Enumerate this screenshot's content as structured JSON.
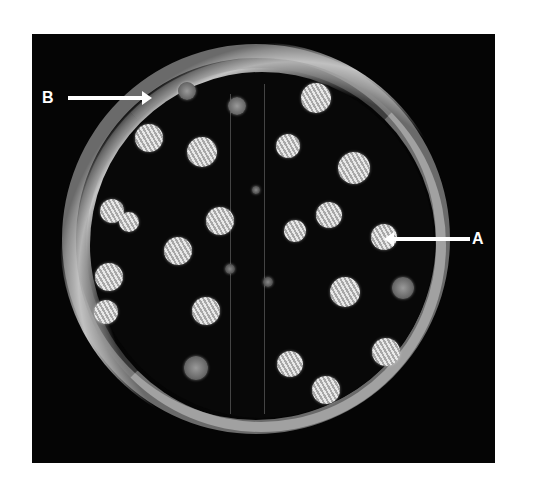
{
  "image": {
    "subject": "petri-dish-with-colonies",
    "background_color": "#050505"
  },
  "annotations": {
    "label_a": "A",
    "label_b": "B"
  },
  "colonies": [
    {
      "x": 155,
      "y": 57,
      "r": 9,
      "style": "dim"
    },
    {
      "x": 205,
      "y": 72,
      "r": 9,
      "style": "dim"
    },
    {
      "x": 284,
      "y": 64,
      "r": 15,
      "style": "bright"
    },
    {
      "x": 117,
      "y": 104,
      "r": 14,
      "style": "bright"
    },
    {
      "x": 170,
      "y": 118,
      "r": 15,
      "style": "bright"
    },
    {
      "x": 256,
      "y": 112,
      "r": 12,
      "style": "bright"
    },
    {
      "x": 322,
      "y": 134,
      "r": 16,
      "style": "bright"
    },
    {
      "x": 80,
      "y": 177,
      "r": 12,
      "style": "bright"
    },
    {
      "x": 97,
      "y": 188,
      "r": 10,
      "style": "bright"
    },
    {
      "x": 188,
      "y": 187,
      "r": 14,
      "style": "bright"
    },
    {
      "x": 263,
      "y": 197,
      "r": 11,
      "style": "bright"
    },
    {
      "x": 297,
      "y": 181,
      "r": 13,
      "style": "bright"
    },
    {
      "x": 352,
      "y": 203,
      "r": 13,
      "style": "bright"
    },
    {
      "x": 146,
      "y": 217,
      "r": 14,
      "style": "bright"
    },
    {
      "x": 77,
      "y": 243,
      "r": 14,
      "style": "bright"
    },
    {
      "x": 74,
      "y": 278,
      "r": 12,
      "style": "bright"
    },
    {
      "x": 174,
      "y": 277,
      "r": 14,
      "style": "bright"
    },
    {
      "x": 313,
      "y": 258,
      "r": 15,
      "style": "bright"
    },
    {
      "x": 371,
      "y": 254,
      "r": 11,
      "style": "dim"
    },
    {
      "x": 354,
      "y": 318,
      "r": 14,
      "style": "bright"
    },
    {
      "x": 258,
      "y": 330,
      "r": 13,
      "style": "bright"
    },
    {
      "x": 164,
      "y": 334,
      "r": 12,
      "style": "dim"
    },
    {
      "x": 294,
      "y": 356,
      "r": 14,
      "style": "bright"
    },
    {
      "x": 224,
      "y": 156,
      "r": 4,
      "style": "tiny"
    },
    {
      "x": 198,
      "y": 235,
      "r": 5,
      "style": "tiny"
    },
    {
      "x": 236,
      "y": 248,
      "r": 5,
      "style": "tiny"
    }
  ]
}
